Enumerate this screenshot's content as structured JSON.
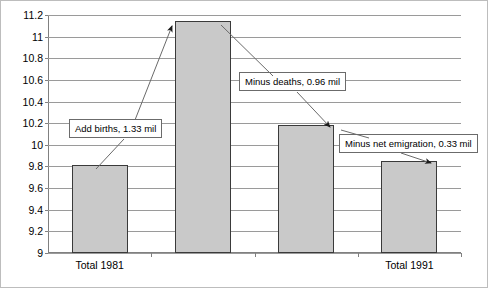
{
  "chart_data": {
    "type": "bar",
    "title": "",
    "subtitle": "",
    "xlabel": "",
    "ylabel": "",
    "ylim": [
      9,
      11.2
    ],
    "ytick_step": 0.2,
    "grid": true,
    "legend": "none",
    "yticks": [
      "11.2",
      "11",
      "10.8",
      "10.6",
      "10.4",
      "10.2",
      "10",
      "9.8",
      "9.6",
      "9.4",
      "9.2",
      "9"
    ],
    "ytick_values": [
      11.2,
      11,
      10.8,
      10.6,
      10.4,
      10.2,
      10,
      9.8,
      9.6,
      9.4,
      9.2,
      9
    ],
    "categories": [
      "Total 1981",
      "",
      "",
      "Total 1991"
    ],
    "values": [
      9.81,
      11.14,
      10.18,
      9.85
    ],
    "bars": [
      {
        "label": "Total 1981",
        "value": 9.81
      },
      {
        "label": "",
        "value": 11.14
      },
      {
        "label": "",
        "value": 10.18
      },
      {
        "label": "Total 1991",
        "value": 9.85
      }
    ],
    "annotations": [
      {
        "text": "Add births, 1.33 mil",
        "value": 1.33
      },
      {
        "text": "Minus deaths, 0.96 mil",
        "value": 0.96
      },
      {
        "text": "Minus net emigration, 0.33 mil",
        "value": 0.33
      }
    ],
    "colors": {
      "bar_fill": "#c9c9c9",
      "bar_border": "#3a3a3a",
      "gridline": "#9a9a9a",
      "axis": "#808080",
      "outer_border": "#bdbdbd",
      "leader_line": "#5a5a5a",
      "text": "#000000"
    }
  }
}
